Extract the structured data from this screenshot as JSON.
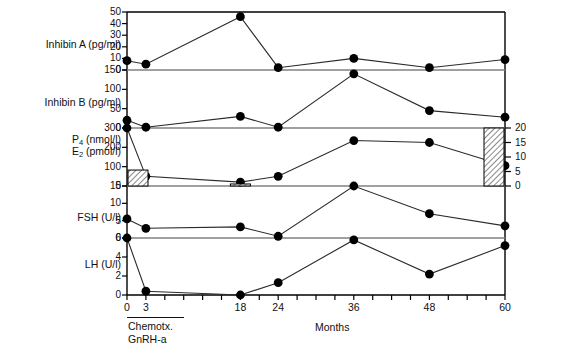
{
  "figure": {
    "xlabel": "Months",
    "treatment": {
      "line1": "Chemotx.",
      "line2": "GnRH-a"
    }
  },
  "chart_data": {
    "type": "line",
    "title": "",
    "xlabel": "Months",
    "ylabel": "",
    "x": [
      0,
      3,
      18,
      24,
      36,
      48,
      60
    ],
    "x_tick_labels": [
      "0",
      "3",
      "18",
      "24",
      "36",
      "48",
      "60"
    ],
    "x_tick_values": [
      0,
      3,
      18,
      24,
      36,
      48,
      60
    ],
    "x_minor_ticks": [
      0,
      3,
      6,
      9,
      12,
      15,
      18,
      21,
      24,
      27,
      30,
      33,
      36,
      39,
      42,
      45,
      48,
      51,
      54,
      57,
      60
    ],
    "xlim": [
      0,
      60
    ],
    "grid": false,
    "legend": "none",
    "annotations": [
      "Chemotx.",
      "GnRH-a"
    ],
    "panels": [
      {
        "name": "inhibin-a",
        "label": "Inhibin A (pg/ml)",
        "unit": "pg/ml",
        "ylim": [
          0,
          50
        ],
        "yticks": [
          0,
          10,
          20,
          30,
          40,
          50
        ],
        "ytick_labels": [
          "0",
          "10",
          "20",
          "30",
          "40",
          "50"
        ],
        "series": [
          {
            "name": "Inhibin A",
            "values": [
              8,
              5,
              46,
              2,
              10,
              2,
              9
            ]
          }
        ]
      },
      {
        "name": "inhibin-b",
        "label": "Inhibin B (pg/ml)",
        "unit": "pg/ml",
        "ylim": [
          0,
          150
        ],
        "yticks": [
          0,
          50,
          100,
          150
        ],
        "ytick_labels": [
          "0",
          "50",
          "100",
          "150"
        ],
        "series": [
          {
            "name": "Inhibin B",
            "values": [
              20,
              2,
              30,
              2,
              140,
              45,
              28
            ]
          }
        ]
      },
      {
        "name": "p4-e2",
        "label_line1": "P4 (nmol/l)",
        "label_line2": "E2 (pmol/l)",
        "label_p4_main": "P",
        "label_p4_sub": "4",
        "label_p4_unit": " (nmol/l)",
        "label_e2_main": "E",
        "label_e2_sub": "2",
        "label_e2_unit": " (pmol/l)",
        "ylim": [
          0,
          300
        ],
        "yticks": [
          0,
          100,
          200,
          300
        ],
        "ytick_labels": [
          "0",
          "100",
          "200",
          "300"
        ],
        "right_axis": {
          "label": "P4 (nmol/l)",
          "ylim": [
            0,
            20
          ],
          "yticks": [
            0,
            5,
            10,
            15,
            20
          ],
          "ytick_labels": [
            "0",
            "5",
            "10",
            "15",
            "20"
          ]
        },
        "series": [
          {
            "name": "E2",
            "type": "line",
            "values": [
              330,
              50,
              20,
              50,
              235,
              225,
              105
            ]
          },
          {
            "name": "P4",
            "type": "bar",
            "x": [
              0,
              18,
              60
            ],
            "values": [
              5.5,
              0.7,
              20
            ]
          }
        ]
      },
      {
        "name": "fsh",
        "label": "FSH (U/l)",
        "unit": "U/l",
        "ylim": [
          0,
          15
        ],
        "yticks": [
          0,
          5,
          10,
          15
        ],
        "ytick_labels": [
          "0",
          "5",
          "10",
          "15"
        ],
        "series": [
          {
            "name": "FSH",
            "values": [
              5.5,
              2.8,
              3.2,
              0.5,
              15,
              7,
              3.5
            ]
          }
        ]
      },
      {
        "name": "lh",
        "label": "LH (U/l)",
        "unit": "U/l",
        "ylim": [
          0,
          6
        ],
        "yticks": [
          0,
          2,
          4,
          6
        ],
        "ytick_labels": [
          "0",
          "2",
          "4",
          "6"
        ],
        "series": [
          {
            "name": "LH",
            "values": [
              6.8,
              0.4,
              0,
              1.3,
              5.8,
              2.2,
              5.2
            ]
          }
        ]
      }
    ]
  },
  "colors": {
    "ink": "#000000",
    "line": "#2a2a2a",
    "marker": "#000000",
    "divider": "#808080",
    "hatch": "#555555"
  }
}
